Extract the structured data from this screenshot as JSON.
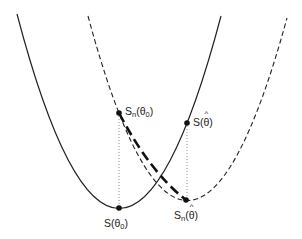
{
  "diagram": {
    "curves": [
      {
        "name": "S",
        "style": "solid",
        "minimum_label": "S(θ0)"
      },
      {
        "name": "S_n",
        "style": "dashed",
        "minimum_label": "S_n(θ̂)"
      }
    ],
    "points": [
      {
        "id": "Sn_theta0",
        "label_main": "S",
        "label_sub": "n",
        "label_arg": "θ",
        "arg_sub": "0",
        "hat": false
      },
      {
        "id": "S_thetahat",
        "label_main": "S",
        "label_sub": "",
        "label_arg": "θ",
        "arg_sub": "",
        "hat": true
      },
      {
        "id": "S_theta0",
        "label_main": "S",
        "label_sub": "",
        "label_arg": "θ",
        "arg_sub": "0",
        "hat": false
      },
      {
        "id": "Sn_thetahat",
        "label_main": "S",
        "label_sub": "n",
        "label_arg": "θ",
        "arg_sub": "",
        "hat": true
      }
    ],
    "colors": {
      "line": "#222222",
      "guide": "#888888"
    }
  }
}
